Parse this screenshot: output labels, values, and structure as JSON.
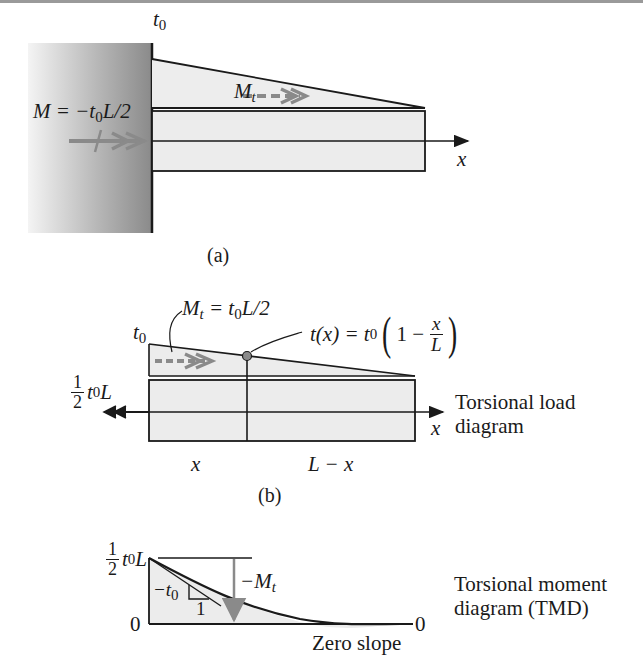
{
  "figure": {
    "panel_a": {
      "caption": "(a)",
      "t0_label": "t",
      "t0_sub": "0",
      "moment_label": "M = −t",
      "moment_sub": "0",
      "moment_tail": "L/2",
      "mt_label": "M",
      "mt_sub": "t",
      "axis_label": "x"
    },
    "panel_b": {
      "caption": "(b)",
      "t0_label": "t",
      "t0_sub": "0",
      "mt_eq_left": "M",
      "mt_eq_sub": "t",
      "mt_eq_mid": " = t",
      "mt_eq_sub2": "0",
      "mt_eq_right": "L/2",
      "tx_left": "t(x) = t",
      "tx_sub": "0",
      "tx_paren_open": "(",
      "tx_one_minus": "1 −",
      "tx_frac_num": "x",
      "tx_frac_den": "L",
      "tx_paren_close": ")",
      "reaction_frac_num": "1",
      "reaction_frac_den": "2",
      "reaction_t": "t",
      "reaction_sub": "0",
      "reaction_L": "L",
      "axis_label": "x",
      "seg_left": "x",
      "seg_right": "L − x",
      "note_line1": "Torsional load",
      "note_line2": "diagram"
    },
    "panel_c": {
      "top_frac_num": "1",
      "top_frac_den": "2",
      "top_t": "t",
      "top_sub": "0",
      "top_L": "L",
      "zero_left": "0",
      "zero_right": "0",
      "slope_label": "−t",
      "slope_sub": "0",
      "slope_run": "1",
      "mt_label": "−M",
      "mt_sub": "t",
      "zero_slope": "Zero slope",
      "note_line1": "Torsional moment",
      "note_line2": "diagram (TMD)"
    },
    "colors": {
      "line": "#1a1a1a",
      "fill_light": "#ececec",
      "arrow_gray": "#8a8a8a",
      "wall_dark": "#8c8c8c",
      "wall_light": "#f2f2f2"
    }
  }
}
